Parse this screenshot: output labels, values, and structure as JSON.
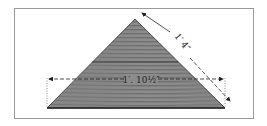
{
  "diagram": {
    "dimensions": {
      "base_label": "1′. 10½″",
      "slant_label": "1′ 4″"
    },
    "colors": {
      "fill": "#8a8a8a",
      "grain": "#5a5a5a",
      "line": "#222222",
      "frame": "#9a9a9a"
    }
  }
}
